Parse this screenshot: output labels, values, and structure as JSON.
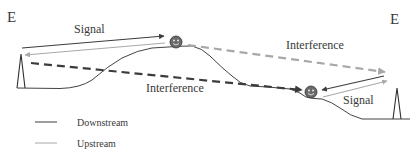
{
  "diagram": {
    "labels": {
      "left_station": "E",
      "right_station": "E",
      "signal_left": "Signal",
      "signal_right": "Signal",
      "interference_top": "Interference",
      "interference_bottom": "Interference"
    },
    "legend": {
      "items": [
        {
          "label": "Downstream",
          "color": "#3c3c3c"
        },
        {
          "label": "Upstream",
          "color": "#a8a8a8"
        }
      ]
    },
    "colors": {
      "downstream": "#3c3c3c",
      "upstream": "#a8a8a8",
      "terrain": "#2e2e2e",
      "tower": "#2e2e2e",
      "user_face": "#5a5a5a"
    },
    "icons": {
      "left_tower": "antenna-tower-icon",
      "right_tower": "antenna-tower-icon",
      "user_top": "smiley-user-icon",
      "user_bottom": "smiley-user-icon"
    }
  }
}
